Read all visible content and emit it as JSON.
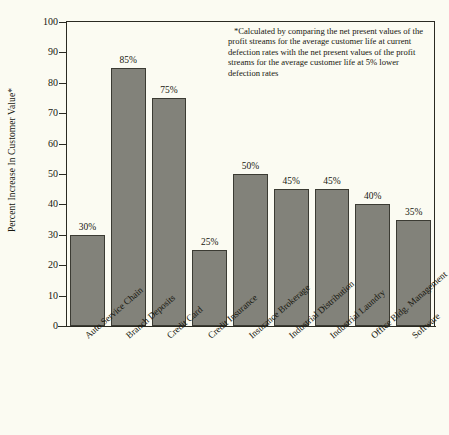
{
  "chart_data": {
    "type": "bar",
    "title": "",
    "xlabel": "",
    "ylabel": "Percent Increase In Customer Value*",
    "ylim": [
      0,
      100
    ],
    "yticks": [
      0,
      10,
      20,
      30,
      40,
      50,
      60,
      70,
      80,
      90,
      100
    ],
    "grid": false,
    "legend": null,
    "categories": [
      "Auto Service Chain",
      "Branch Deposits",
      "Credit Card",
      "Credit Insurance",
      "Insurance Brokerage",
      "Industrial Distribution",
      "Industrial Laundry",
      "Office Bldg. Management",
      "Software"
    ],
    "values": [
      30,
      85,
      75,
      25,
      50,
      45,
      45,
      40,
      35
    ],
    "value_labels": [
      "30%",
      "85%",
      "75%",
      "25%",
      "50%",
      "45%",
      "45%",
      "40%",
      "35%"
    ],
    "annotation": "*Calculated by comparing the net present values of the profit streams for the average customer life at current defection rates with the net present values of the profit streams for the average customer life at 5% lower defection rates",
    "colors": {
      "bar_fill": "#82827a",
      "bar_edge": "#3b3b33",
      "axis": "#2a2a22",
      "background": "#fbfbf2",
      "text": "#17170f"
    }
  }
}
